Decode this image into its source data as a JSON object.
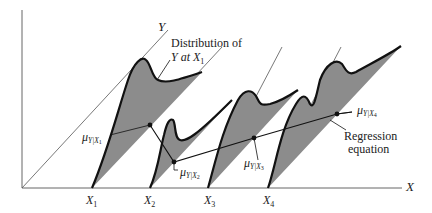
{
  "diagram": {
    "axes": {
      "x_label": "X",
      "y_label": "Y"
    },
    "x_ticks": [
      {
        "label": "X",
        "sub": "1"
      },
      {
        "label": "X",
        "sub": "2"
      },
      {
        "label": "X",
        "sub": "3"
      },
      {
        "label": "X",
        "sub": "4"
      }
    ],
    "annotations": {
      "distribution_line1": "Distribution of",
      "distribution_line2_prefix": "Y at ",
      "distribution_line2_var": "X",
      "distribution_line2_sub": "1",
      "regression_line1": "Regression",
      "regression_line2": "equation"
    },
    "means": [
      {
        "mu": "μ",
        "sub": "Y|X",
        "subsub": "1"
      },
      {
        "mu": "μ",
        "sub": "Y|X",
        "subsub": "2"
      },
      {
        "mu": "μ",
        "sub": "Y|X",
        "subsub": "3"
      },
      {
        "mu": "μ",
        "sub": "Y|X",
        "subsub": "4"
      }
    ],
    "colors": {
      "fill": "#8c8c8c",
      "stroke": "#111111",
      "thin": "#555555"
    }
  }
}
